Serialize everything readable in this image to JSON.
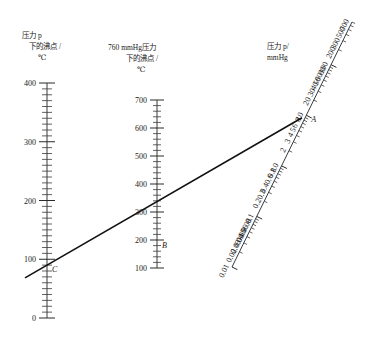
{
  "figure": {
    "type": "nomogram",
    "title": "",
    "background": "#ffffff",
    "line_color": "#111111",
    "axis_color": "#3a3a3a"
  },
  "axes": {
    "left": {
      "name": "boiling-point-at-pressure-p",
      "title_line1": "压力 p",
      "title_line2": "下的沸点 /",
      "title_line3": "℃",
      "scale": "linear",
      "min": 0,
      "max": 400,
      "unit": "℃",
      "tick_labels": [
        "400",
        "300",
        "200",
        "100",
        "0"
      ],
      "tick_values": [
        400,
        300,
        200,
        100,
        0
      ],
      "minor_step": 10
    },
    "middle": {
      "name": "boiling-point-at-760mmhg",
      "title_line1": "760 mmHg压力",
      "title_line2": "下的沸点 /",
      "title_line3": "℃",
      "scale": "linear",
      "min": 100,
      "max": 700,
      "unit": "℃",
      "tick_labels": [
        "700",
        "600",
        "500",
        "400",
        "300",
        "200",
        "100"
      ],
      "tick_values": [
        700,
        600,
        500,
        400,
        300,
        200,
        100
      ],
      "minor_step": 20
    },
    "right": {
      "name": "pressure-p-mmhg",
      "title_line1": "压力 p/",
      "title_line2": "mmHg",
      "scale": "log",
      "min": 0.01,
      "max": 700,
      "unit": "mmHg",
      "tick_labels": [
        "0.01",
        "0.02",
        "0.03",
        "0.04",
        "0.05",
        "0.06",
        "0.08",
        "0.1",
        "0.2",
        "0.3",
        "0.4",
        "0.6",
        "0.8",
        "1.0",
        "2",
        "3",
        "4",
        "5",
        "6",
        "8",
        "10",
        "20",
        "30",
        "40",
        "50",
        "60",
        "80",
        "100",
        "200",
        "300",
        "500",
        "700"
      ],
      "tick_values": [
        0.01,
        0.02,
        0.03,
        0.04,
        0.05,
        0.06,
        0.08,
        0.1,
        0.2,
        0.3,
        0.4,
        0.6,
        0.8,
        1.0,
        2,
        3,
        4,
        5,
        6,
        8,
        10,
        20,
        30,
        40,
        50,
        60,
        80,
        100,
        200,
        300,
        500,
        700
      ]
    }
  },
  "points": {
    "a": {
      "label": "A",
      "axis": "right",
      "value": 10,
      "unit": "mmHg"
    },
    "b": {
      "label": "B",
      "axis": "middle",
      "value": 195,
      "unit": "℃"
    },
    "c": {
      "label": "C",
      "axis": "left",
      "value": 90,
      "unit": "℃"
    }
  },
  "chart_data": {
    "type": "line",
    "xlabel": "",
    "ylabel": "",
    "series": [
      {
        "name": "index-line-ABC",
        "description": "连接三个标尺的读数直线",
        "points": [
          {
            "label": "C",
            "scale": "压力 p 下的沸点 / ℃",
            "value": 90
          },
          {
            "label": "B",
            "scale": "760 mmHg压力下的沸点 / ℃",
            "value": 195
          },
          {
            "label": "A",
            "scale": "压力 p / mmHg",
            "value": 10
          }
        ]
      }
    ],
    "legend": "none",
    "grid": false
  }
}
